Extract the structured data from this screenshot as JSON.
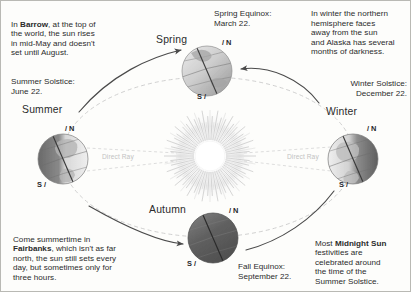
{
  "diagram": {
    "colors": {
      "background": "#fdfdfb",
      "border": "#b9b9b4",
      "text": "#2b2b2b",
      "ray_label": "#c2c2c2",
      "orbit": "#c9c9c9",
      "arrow": "#4a4a4a",
      "earth_day": "#cfcfcf",
      "earth_night": "#5d5d5d",
      "sun_core": "#ffffff"
    }
  },
  "annotations": {
    "barrow": {
      "lines": [
        "In ",
        "Barrow",
        ", at the top of the world, the sun rises in mid-May and doesn't set until August."
      ],
      "text": "In Barrow, at the top of the world, the sun rises in mid-May and doesn't set until August.",
      "prefix": "In ",
      "bold": "Barrow",
      "suffix": ", at the top of\nthe world, the sun rises\nin mid-May and doesn't\nset until August."
    },
    "winter_note": {
      "text": "In winter the northern\nhemisphere faces\naway from the sun\nand Alaska has several\nmonths of darkness."
    },
    "fairbanks": {
      "prefix": "Come summertime in\n",
      "bold": "Fairbanks",
      "suffix": ", which isn't as far\nnorth, the sun still sets every\nday, but sometimes only for\nthree hours."
    },
    "midnight_sun": {
      "prefix": "Most ",
      "bold": "Midnight Sun",
      "suffix": "\nfestivities are\ncelebrated around\nthe time of the\nSummer Solstice."
    }
  },
  "events": {
    "spring_equinox": "Spring Equinox:\nMarch 22.",
    "summer_solstice": "Summer Solstice:\nJune 22.",
    "winter_solstice": "Winter Solstice:\nDecember 22.",
    "fall_equinox": "Fall Equinox:\nSeptember 22."
  },
  "seasons": [
    {
      "key": "spring",
      "label": "Spring",
      "north_pole": "N",
      "south_pole": "S",
      "position": "top",
      "lit_side": "uniform"
    },
    {
      "key": "summer",
      "label": "Summer",
      "north_pole": "N",
      "south_pole": "S",
      "position": "left",
      "lit_side": "right"
    },
    {
      "key": "autumn",
      "label": "Autumn",
      "north_pole": "N",
      "south_pole": "S",
      "position": "bottom",
      "lit_side": "dark"
    },
    {
      "key": "winter",
      "label": "Winter",
      "north_pole": "N",
      "south_pole": "S",
      "position": "right",
      "lit_side": "left"
    }
  ],
  "rays": {
    "left_label": "Direct Ray",
    "right_label": "Direct Ray"
  }
}
